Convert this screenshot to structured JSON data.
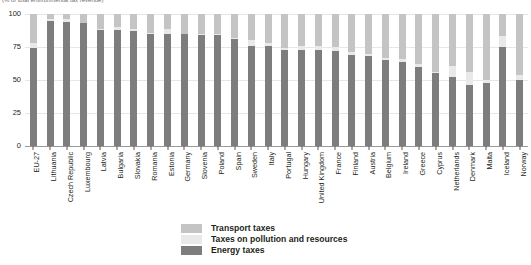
{
  "chart_data": {
    "type": "bar",
    "subtype": "stacked-100-percent",
    "title": "(% of total environmental tax revenue)",
    "xlabel": "",
    "ylabel": "",
    "ylim": [
      0,
      100
    ],
    "yticks": [
      0,
      25,
      50,
      75,
      100
    ],
    "grid": true,
    "legend_position": "bottom",
    "stack_order_bottom_to_top": [
      "Energy taxes",
      "Taxes on pollution and resources",
      "Transport taxes"
    ],
    "categories": [
      "EU-27",
      "Lithuania",
      "Czech Republic",
      "Luxembourg",
      "Latvia",
      "Bulgaria",
      "Slovakia",
      "Romania",
      "Estonia",
      "Germany",
      "Slovenia",
      "Poland",
      "Spain",
      "Sweden",
      "Italy",
      "Portugal",
      "Hungary",
      "United Kingdom",
      "France",
      "Finland",
      "Austria",
      "Belgium",
      "Ireland",
      "Greece",
      "Cyprus",
      "Netherlands",
      "Denmark",
      "Malta",
      "Iceland",
      "Norway"
    ],
    "series": [
      {
        "name": "Energy taxes",
        "color": "#7d7d7d",
        "values": [
          74,
          95,
          94,
          93,
          88,
          88,
          87,
          85,
          85,
          85,
          84,
          84,
          81,
          76,
          76,
          73,
          73,
          73,
          72,
          69,
          68,
          65,
          64,
          60,
          55,
          52,
          46,
          48,
          75,
          50
        ]
      },
      {
        "name": "Taxes on pollution and resources",
        "color": "#e9e9e9",
        "values": [
          4,
          1,
          2,
          0,
          1,
          2,
          2,
          1,
          4,
          0,
          1,
          1,
          1,
          4,
          2,
          1,
          3,
          3,
          3,
          2,
          2,
          2,
          2,
          2,
          1,
          9,
          10,
          2,
          8,
          4
        ]
      },
      {
        "name": "Transport taxes",
        "color": "#c4c4c4",
        "values": [
          22,
          4,
          4,
          7,
          11,
          10,
          11,
          14,
          11,
          15,
          15,
          15,
          18,
          20,
          22,
          26,
          24,
          24,
          25,
          29,
          30,
          33,
          34,
          38,
          44,
          39,
          44,
          50,
          17,
          46
        ]
      }
    ]
  },
  "legend": {
    "items": [
      {
        "label": "Transport taxes",
        "color": "#c4c4c4",
        "swatch_name": "legend-swatch-transport"
      },
      {
        "label": "Taxes on pollution and resources",
        "color": "#e9e9e9",
        "swatch_name": "legend-swatch-pollution"
      },
      {
        "label": "Energy taxes",
        "color": "#7d7d7d",
        "swatch_name": "legend-swatch-energy"
      }
    ]
  }
}
